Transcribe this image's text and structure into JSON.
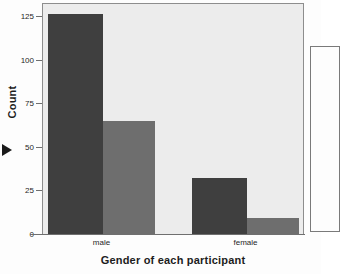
{
  "chart_data": {
    "type": "bar",
    "title": "",
    "subtitle": "",
    "xlabel": "Gender of each participant",
    "ylabel": "Count",
    "categories": [
      "male",
      "female"
    ],
    "series": [
      {
        "name": "series-1",
        "color": "#3f3f3f",
        "values": [
          126,
          32
        ]
      },
      {
        "name": "series-2",
        "color": "#6e6e6e",
        "values": [
          65,
          9
        ]
      }
    ],
    "ylim": [
      0,
      132
    ],
    "yticks": [
      0,
      25,
      50,
      75,
      100,
      125
    ],
    "ytick_labels": [
      "0",
      "25",
      "50",
      "75",
      "100",
      "125"
    ],
    "grid": false,
    "legend_position": "right",
    "legend_entries": [],
    "plot_background": "#ececec",
    "axis_color": "#6f6f6f"
  },
  "figure": {
    "y_axis_title": "Count",
    "x_axis_title": "Gender of each participant",
    "cursor_icon": "pointer-triangle-icon"
  }
}
